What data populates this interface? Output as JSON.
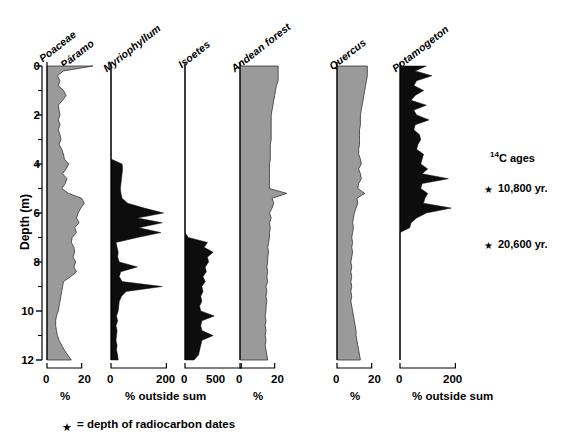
{
  "figure": {
    "type": "pollen-stratigraphic-diagram",
    "y_axis": {
      "title": "Depth (m)",
      "unit": "m",
      "ticks": [
        "0",
        "2",
        "4",
        "6",
        "8",
        "10",
        "12"
      ],
      "tick_values": [
        0,
        2,
        4,
        6,
        8,
        10,
        12
      ],
      "minor_tick_values": [
        1,
        3,
        5,
        7,
        9,
        11
      ],
      "range": [
        0,
        12
      ],
      "direction": "inverted"
    },
    "panels": [
      {
        "name": "poaceae",
        "header_line1": "Poaceae",
        "header_line2": "= Páramo",
        "fill": "gray",
        "xlabel": "%",
        "xticks": [
          "0",
          "20"
        ],
        "xlim": [
          0,
          30
        ],
        "tick_values": [
          0,
          20
        ]
      },
      {
        "name": "myriophyllum",
        "header_line1": "Myriophyllum",
        "header_line2": "",
        "fill": "black",
        "xlabel": "% outside sum",
        "xticks": [
          "0",
          "200"
        ],
        "xlim": [
          0,
          260
        ],
        "tick_values": [
          0,
          200
        ]
      },
      {
        "name": "isoetes",
        "header_line1": "Isoetes",
        "header_line2": "",
        "fill": "black",
        "xlabel": "",
        "xticks": [
          "0",
          "500"
        ],
        "xlim": [
          0,
          640
        ],
        "tick_values": [
          0,
          500
        ]
      },
      {
        "name": "andean-forest",
        "header_line1": "Andean forest",
        "header_line2": "",
        "fill": "gray",
        "xlabel": "%",
        "xticks": [
          "0",
          "20"
        ],
        "xlim": [
          0,
          30
        ],
        "tick_values": [
          0,
          20
        ]
      },
      {
        "name": "quercus",
        "header_line1": "Quercus",
        "header_line2": "",
        "fill": "gray",
        "xlabel": "%",
        "xticks": [
          "0",
          "20"
        ],
        "xlim": [
          0,
          30
        ],
        "tick_values": [
          0,
          20
        ]
      },
      {
        "name": "potamogeton",
        "header_line1": "Potamogeton",
        "header_line2": "",
        "fill": "black",
        "xlabel": "% outside sum",
        "xticks": [
          "0",
          "200"
        ],
        "xlim": [
          0,
          260
        ],
        "tick_values": [
          0,
          200
        ]
      }
    ],
    "annotations": {
      "ages_title_pre": "14",
      "ages_title": "C ages",
      "date1": "10,800 yr.",
      "date2": "20,600 yr.",
      "star_glyph": "★",
      "legend": "= depth of radiocarbon dates"
    },
    "colors": {
      "gray_fill": "#9a9a9a",
      "black_fill": "#0d0d0d",
      "axis": "#000000",
      "background": "#ffffff"
    }
  },
  "chart_data": {
    "type": "area",
    "xlabel": "% / % outside sum",
    "ylabel": "Depth (m)",
    "ylim": [
      0,
      12
    ],
    "y_inverted": true,
    "grid": false,
    "legend_position": "none",
    "depths_m": [
      0.0,
      0.2,
      0.4,
      0.6,
      0.8,
      1.0,
      1.2,
      1.4,
      1.6,
      1.8,
      2.0,
      2.2,
      2.4,
      2.6,
      2.8,
      3.0,
      3.2,
      3.4,
      3.6,
      3.8,
      4.0,
      4.2,
      4.4,
      4.6,
      4.8,
      5.0,
      5.2,
      5.4,
      5.6,
      5.8,
      6.0,
      6.2,
      6.4,
      6.6,
      6.8,
      7.0,
      7.2,
      7.4,
      7.6,
      7.8,
      8.0,
      8.2,
      8.4,
      8.6,
      8.8,
      9.0,
      9.2,
      9.4,
      9.6,
      9.8,
      10.0,
      10.2,
      10.4,
      10.6,
      10.8,
      11.0,
      11.2,
      11.4,
      11.6,
      11.8,
      12.0
    ],
    "series": [
      {
        "name": "Poaceae = Páramo",
        "unit": "%",
        "fill": "gray",
        "xlim": [
          0,
          30
        ],
        "values": [
          26.5,
          9.5,
          6.0,
          7.5,
          6.5,
          9.5,
          11.0,
          9.0,
          6.5,
          7.0,
          7.5,
          6.5,
          7.5,
          6.5,
          7.5,
          8.0,
          7.0,
          8.5,
          9.5,
          10.0,
          12.5,
          11.0,
          9.0,
          11.5,
          10.5,
          8.5,
          12.5,
          20.0,
          21.5,
          19.5,
          18.0,
          17.0,
          18.5,
          16.0,
          17.0,
          14.5,
          14.0,
          15.5,
          16.0,
          15.0,
          16.5,
          15.5,
          17.0,
          13.5,
          9.5,
          9.0,
          8.5,
          8.0,
          7.5,
          7.0,
          6.5,
          5.5,
          5.0,
          5.0,
          5.5,
          6.0,
          7.0,
          8.5,
          10.0,
          12.0,
          14.0
        ]
      },
      {
        "name": "Myriophyllum",
        "unit": "% outside sum",
        "fill": "black",
        "xlim": [
          0,
          260
        ],
        "values": [
          0,
          0,
          0,
          0,
          0,
          0,
          0,
          0,
          0,
          0,
          0,
          0,
          0,
          0,
          0,
          0,
          0,
          0,
          0,
          0,
          40,
          42,
          40,
          38,
          36,
          34,
          36,
          40,
          60,
          120,
          190,
          95,
          185,
          100,
          180,
          95,
          18,
          22,
          26,
          24,
          30,
          95,
          35,
          30,
          40,
          185,
          55,
          38,
          30,
          28,
          26,
          20,
          24,
          18,
          22,
          20,
          18,
          22,
          20,
          24,
          26
        ]
      },
      {
        "name": "Isoetes",
        "unit": "% outside sum",
        "fill": "black",
        "xlim": [
          0,
          640
        ],
        "values": [
          0,
          0,
          0,
          0,
          0,
          0,
          0,
          0,
          0,
          0,
          0,
          0,
          0,
          0,
          0,
          0,
          0,
          0,
          0,
          0,
          0,
          0,
          0,
          0,
          0,
          0,
          0,
          0,
          0,
          0,
          0,
          0,
          0,
          0,
          0,
          30,
          200,
          170,
          250,
          200,
          210,
          180,
          190,
          160,
          180,
          150,
          160,
          140,
          150,
          130,
          140,
          260,
          150,
          140,
          150,
          250,
          150,
          140,
          130,
          120,
          80
        ]
      },
      {
        "name": "Andean forest",
        "unit": "%",
        "fill": "gray",
        "xlim": [
          0,
          30
        ],
        "values": [
          22.0,
          22.0,
          22.0,
          22.0,
          21.0,
          20.5,
          20.0,
          19.5,
          19.0,
          18.5,
          18.0,
          18.0,
          18.0,
          18.0,
          18.0,
          18.0,
          17.5,
          17.5,
          17.5,
          17.5,
          17.0,
          17.0,
          17.0,
          17.0,
          17.0,
          17.0,
          27.0,
          18.5,
          19.5,
          18.5,
          17.0,
          18.0,
          17.0,
          17.5,
          17.0,
          17.0,
          16.5,
          16.0,
          16.5,
          16.0,
          16.0,
          15.5,
          16.0,
          15.5,
          16.0,
          15.0,
          15.5,
          15.0,
          15.5,
          15.0,
          15.0,
          14.5,
          15.0,
          14.5,
          15.0,
          14.5,
          15.0,
          14.5,
          15.0,
          15.5,
          16.0
        ]
      },
      {
        "name": "Quercus",
        "unit": "%",
        "fill": "gray",
        "xlim": [
          0,
          30
        ],
        "values": [
          17.5,
          17.5,
          17.5,
          17.0,
          16.5,
          16.0,
          15.5,
          15.0,
          14.5,
          14.0,
          13.5,
          13.5,
          13.5,
          13.0,
          13.0,
          13.0,
          13.0,
          12.5,
          12.5,
          13.5,
          14.0,
          12.5,
          13.5,
          14.0,
          12.5,
          12.0,
          16.0,
          11.5,
          12.0,
          11.0,
          10.0,
          9.5,
          9.0,
          9.5,
          9.0,
          8.5,
          9.0,
          8.5,
          9.0,
          8.5,
          8.0,
          8.5,
          8.0,
          8.5,
          8.0,
          8.5,
          8.0,
          8.5,
          8.0,
          8.5,
          9.0,
          9.5,
          10.0,
          10.5,
          11.0,
          11.0,
          11.5,
          12.0,
          12.5,
          13.0,
          13.5
        ]
      },
      {
        "name": "Potamogeton",
        "unit": "% outside sum",
        "fill": "black",
        "xlim": [
          0,
          260
        ],
        "values": [
          95,
          55,
          115,
          60,
          50,
          85,
          55,
          40,
          95,
          50,
          60,
          105,
          55,
          50,
          70,
          75,
          65,
          60,
          85,
          80,
          75,
          100,
          80,
          175,
          80,
          75,
          100,
          90,
          85,
          185,
          95,
          60,
          40,
          35,
          0,
          0,
          0,
          0,
          0,
          0,
          0,
          0,
          0,
          0,
          0,
          0,
          0,
          0,
          0,
          0,
          0,
          0,
          0,
          0,
          0,
          0,
          0,
          0,
          0,
          0,
          0
        ]
      }
    ]
  }
}
